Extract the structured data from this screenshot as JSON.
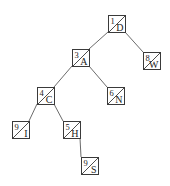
{
  "diagram": {
    "type": "binary-tree",
    "node_size": 17,
    "colors": {
      "stroke": "#3a3a3a",
      "edge": "#5a5a5a",
      "text": "#222222",
      "background": "#ffffff"
    },
    "nodes": [
      {
        "id": "D",
        "number": "1",
        "label": "D",
        "x": 108,
        "y": 15
      },
      {
        "id": "A",
        "number": "3",
        "label": "A",
        "x": 72,
        "y": 49
      },
      {
        "id": "W",
        "number": "8",
        "label": "W",
        "x": 143,
        "y": 52
      },
      {
        "id": "C",
        "number": "4",
        "label": "C",
        "x": 37,
        "y": 87
      },
      {
        "id": "N",
        "number": "6",
        "label": "N",
        "x": 107,
        "y": 87
      },
      {
        "id": "I",
        "number": "9",
        "label": "I",
        "x": 12,
        "y": 121
      },
      {
        "id": "H",
        "number": "5",
        "label": "H",
        "x": 63,
        "y": 121
      },
      {
        "id": "S",
        "number": "9",
        "label": "S",
        "x": 81,
        "y": 157
      }
    ],
    "edges": [
      {
        "from": "D",
        "to": "A",
        "side": "left"
      },
      {
        "from": "D",
        "to": "W",
        "side": "right"
      },
      {
        "from": "A",
        "to": "C",
        "side": "left"
      },
      {
        "from": "A",
        "to": "N",
        "side": "right"
      },
      {
        "from": "C",
        "to": "I",
        "side": "left"
      },
      {
        "from": "C",
        "to": "H",
        "side": "right"
      },
      {
        "from": "H",
        "to": "S",
        "side": "right"
      }
    ]
  }
}
